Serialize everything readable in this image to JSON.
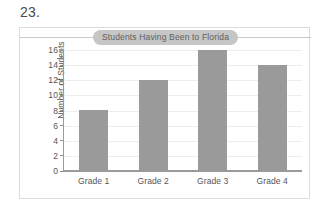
{
  "problem": {
    "number_label": "23."
  },
  "chart_data": {
    "type": "bar",
    "title": "Students Having Been to Florida",
    "xlabel": "",
    "ylabel": "Number of Students",
    "categories": [
      "Grade 1",
      "Grade 2",
      "Grade 3",
      "Grade 4"
    ],
    "values": [
      8,
      12,
      16,
      14
    ],
    "ylim": [
      0,
      16
    ],
    "ytick_labels": [
      "16",
      "14",
      "12",
      "10",
      "8",
      "6",
      "4",
      "2",
      "0"
    ],
    "ytick_values": [
      16,
      14,
      12,
      10,
      8,
      6,
      4,
      2,
      0
    ],
    "ytick_step": 2,
    "grid": "horizontal",
    "legend": "none",
    "bar_color": "#9a9a9a",
    "gridline_color": "#ededed",
    "axis_color": "#9a9a9a",
    "title_pill_color": "#c6c6c6",
    "text_color": "#555555",
    "frame_border_color": "#dcdcdc",
    "background_color": "#ffffff"
  }
}
